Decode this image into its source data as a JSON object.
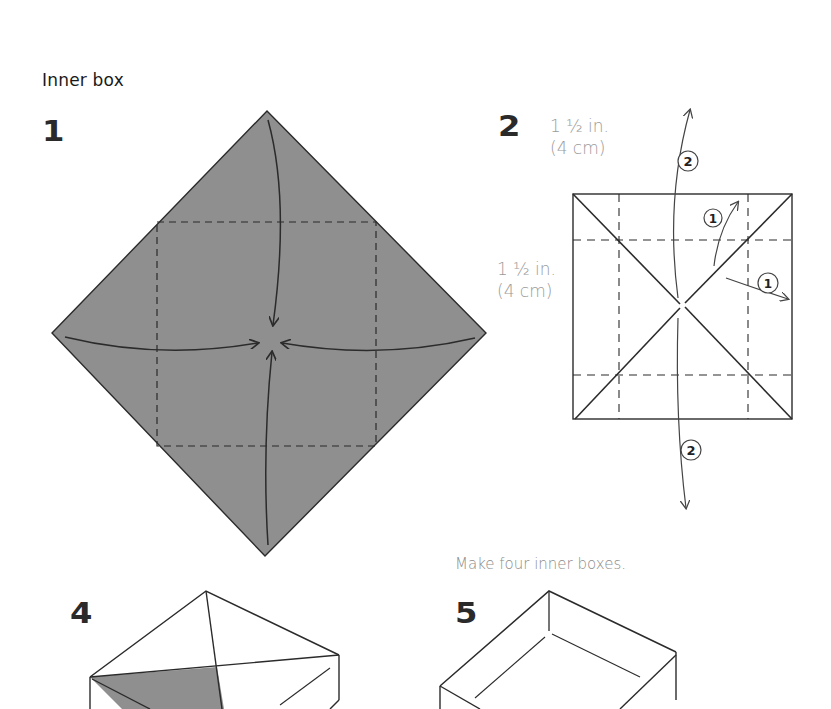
{
  "section": {
    "title": "Inner box"
  },
  "steps": [
    {
      "number": "1",
      "description": "Colored square paper placed as diamond; fold all four corners to the center along dashed lines."
    },
    {
      "number": "2",
      "measure_top": {
        "line1": "1 ½ in.",
        "line2": "(4 cm)"
      },
      "measure_side": {
        "line1": "1 ½ in.",
        "line2": "(4 cm)"
      },
      "callouts": [
        "1",
        "1",
        "2",
        "2"
      ]
    },
    {
      "number": "4"
    },
    {
      "number": "5",
      "caption": "Make four inner boxes."
    }
  ],
  "colors": {
    "paper_fill": "#8f8f8f",
    "line": "#2b2b2b",
    "label_gray": "#9a9a9a",
    "background": "#ffffff"
  }
}
